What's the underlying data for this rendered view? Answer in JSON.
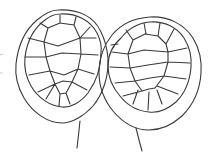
{
  "figure": {
    "canvas": {
      "width": 210,
      "height": 154
    },
    "background": "#ffffff",
    "stroke_color": "#3a3a3a",
    "stroke_width": 1.1,
    "shells": [
      {
        "name": "left-carapace",
        "paths": [
          {
            "name": "outline",
            "d": "M 58 10 C 78 9, 94 16, 101 32 C 104 38, 107 48, 108 58 C 109 76, 103 94, 93 106 C 84 116, 72 123, 62 123 C 48 123, 33 113, 24 98 C 17 86, 15 74, 16 64 C 18 46, 25 30, 37 20 C 43 15, 50 10, 58 10 Z"
          },
          {
            "name": "inner-rim",
            "d": "M 60 14 C 76 13, 90 20, 97 33 C 100 39, 102 45, 101 52 C 101 67, 96 82, 88 93 C 81 102, 71 108, 62 107 C 50 106, 38 98, 31 86 C 26 77, 24 66, 25 57 C 27 42, 34 28, 45 20 C 50 16, 55 14, 60 14 Z"
          },
          {
            "name": "scute-network",
            "d": "M 40 23 L 48 28 M 60 15 L 60 23 M 76 17 L 74 25 M 90 27 L 80 38 M 48 28 L 60 23 L 74 25 M 48 28 L 44 42 L 46 57 L 50 71 L 55 84 L 60 94 M 74 25 L 80 38 L 81 54 L 78 69 L 72 82 L 66 93 M 44 42 L 58 46 L 80 38 M 46 57 L 62 53 L 81 54 M 50 71 L 64 75 L 78 69 M 55 84 L 63 81 L 72 82 M 60 94 L 66 93 M 44 42 L 28 38 M 46 57 L 25 57 M 50 71 L 29 75 M 55 84 L 38 92 M 55 84 L 46 99 M 80 38 L 96 38 M 81 54 L 98 55 M 78 69 L 94 74 M 72 82 L 87 90 M 60 94 L 59 106 M 66 93 L 70 104"
          },
          {
            "name": "tail-line",
            "d": "M 80 121 C 79 130, 78 140, 77 148"
          }
        ]
      },
      {
        "name": "right-carapace",
        "paths": [
          {
            "name": "outline",
            "d": "M 150 17 C 168 16, 184 24, 193 38 C 199 48, 202 60, 201 73 C 200 90, 193 105, 182 116 C 172 125, 160 130, 149 130 C 136 130, 123 123, 113 111 C 104 100, 99 86, 99 72 C 99 58, 104 45, 112 35 C 121 24, 135 18, 150 17 Z"
          },
          {
            "name": "inner-rim",
            "d": "M 150 22 C 164 21, 177 27, 184 38 C 189 46, 192 56, 191 67 C 190 81, 185 93, 176 102 C 168 109, 158 113, 149 112 C 138 111, 127 105, 120 96 C 113 88, 108 77, 108 66 C 108 55, 113 45, 121 38 C 128 29, 138 23, 150 22 Z"
          },
          {
            "name": "scute-network",
            "d": "M 126 30 L 133 40 M 144 23 L 146 34 M 160 23 L 158 36 M 174 29 L 166 44 M 111 45 L 118 44 M 133 40 L 145 34 L 158 36 M 133 40 L 128 54 L 130 68 L 135 81 L 142 91 M 158 36 L 166 44 L 168 52 L 168 62 L 164 76 L 155 88 M 128 54 L 144 50 L 168 52 M 130 68 L 148 65 L 168 62 M 135 81 L 150 78 L 164 76 M 142 91 L 149 89 L 155 88 M 112 52 L 128 54 M 110 67 L 130 68 M 115 83 L 135 81 M 123 96 L 142 91 M 187 48 L 168 52 M 190 63 L 168 62 M 186 79 L 164 76 M 178 94 L 157 86 M 133 104 L 138 90 M 148 110 L 149 92 M 162 104 L 157 90"
          },
          {
            "name": "tail-line",
            "d": "M 136 128 C 138 136, 140 144, 142 151"
          }
        ]
      }
    ],
    "artifacts": {
      "name": "scan-marks",
      "color": "#b5b5b5",
      "d": "M 0 55 L 3 54 M 0 73 L 2 73"
    }
  }
}
